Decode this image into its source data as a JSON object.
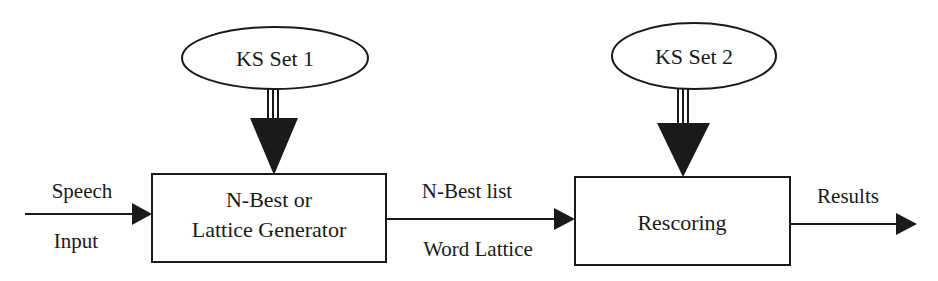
{
  "diagram": {
    "nodes": {
      "ks_set_1": {
        "label": "KS Set 1",
        "shape": "ellipse"
      },
      "ks_set_2": {
        "label": "KS Set 2",
        "shape": "ellipse"
      },
      "generator": {
        "label_line1": "N-Best or",
        "label_line2": "Lattice Generator",
        "shape": "rectangle"
      },
      "rescoring": {
        "label": "Rescoring",
        "shape": "rectangle"
      }
    },
    "edges": {
      "input": {
        "label_top": "Speech",
        "label_bottom": "Input",
        "to": "generator"
      },
      "middle": {
        "label_top": "N-Best list",
        "label_bottom": "Word Lattice",
        "from": "generator",
        "to": "rescoring"
      },
      "output": {
        "label_top": "Results",
        "from": "rescoring"
      },
      "ks1_feed": {
        "from": "ks_set_1",
        "to": "generator",
        "style": "triple-line-arrow"
      },
      "ks2_feed": {
        "from": "ks_set_2",
        "to": "rescoring",
        "style": "triple-line-arrow"
      }
    },
    "colors": {
      "stroke": "#1a1a1a",
      "fill": "#ffffff",
      "background": "#ffffff"
    }
  }
}
